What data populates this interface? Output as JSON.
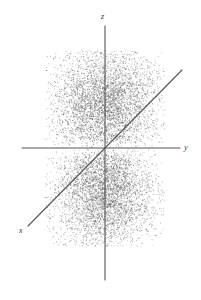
{
  "figure": {
    "background_color": "#ffffff",
    "axis_color": "#555555",
    "point_color": "#4a4a4a",
    "width": 201,
    "height": 300
  },
  "axes": {
    "z": {
      "label": "z",
      "orientation": "vertical",
      "x": 105,
      "y_top": 26,
      "y_bottom": 280
    },
    "y": {
      "label": "y",
      "orientation": "horizontal",
      "y": 148,
      "x_left": 22,
      "x_right": 180
    },
    "x": {
      "label": "x",
      "orientation": "diagonal",
      "x_start": 182,
      "y_start": 70,
      "x_end": 28,
      "y_end": 226
    }
  },
  "chart_data": {
    "type": "scatter",
    "title": "",
    "subtitle": "",
    "xlabel": "y",
    "ylabel": "z",
    "zlabel": "x",
    "grid": false,
    "legend": null,
    "annotations": [],
    "origin_px": [
      105,
      148
    ],
    "point_count": 9000,
    "point_radius_px": 0.55,
    "point_opacity": 0.55,
    "lobes": [
      {
        "name": "upper-lobe",
        "center_px": [
          105,
          103
        ],
        "sigma_px": [
          26,
          27
        ],
        "sign": "+"
      },
      {
        "name": "lower-lobe",
        "center_px": [
          105,
          193
        ],
        "sigma_px": [
          26,
          27
        ],
        "sign": "-"
      }
    ],
    "cloud_extent_px": {
      "x_min": 45,
      "x_max": 165,
      "y_min": 50,
      "y_max": 246
    },
    "nodal_plane_px_y": 148,
    "axis_ranges": {
      "x": [
        -1,
        1
      ],
      "y": [
        -1,
        1
      ],
      "z": [
        -1,
        1
      ]
    }
  }
}
